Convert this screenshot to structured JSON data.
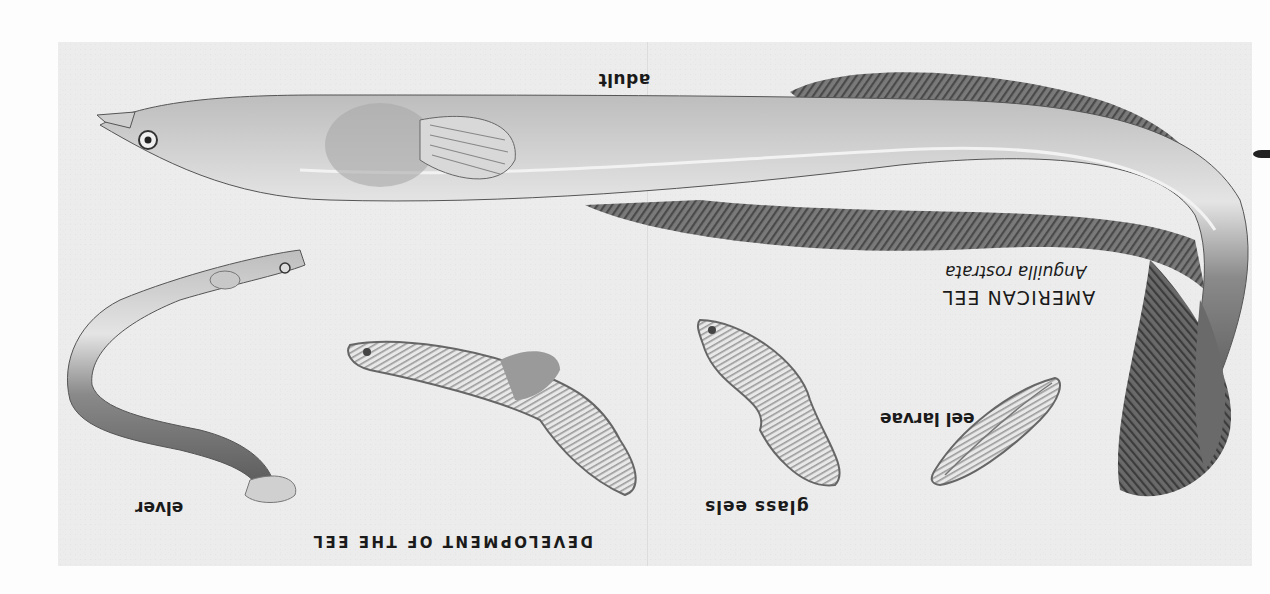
{
  "plate": {
    "title": "DEVELOPMENT OF THE EEL",
    "species_name": "AMERICAN EEL",
    "scientific_name": "Anguilla rostrata",
    "orientation": "rotated 180°",
    "labels": {
      "adult": "adult",
      "eel_larvae": "eel larvae",
      "glass_eels": "glass eels",
      "elver": "elver"
    },
    "illustrations": [
      {
        "name": "adult",
        "description": "large adult eel with dorsal and anal fins"
      },
      {
        "name": "eel larvae",
        "description": "leaf-shaped transparent larva"
      },
      {
        "name": "glass eels",
        "description": "two twisted ribbon-shaped larvae"
      },
      {
        "name": "elver",
        "description": "young curved eel"
      }
    ]
  },
  "colors": {
    "paper": "#fdfdfd",
    "plate_bg": "#ececec",
    "ink": "#1a1a1a",
    "body_dark": "#6e6e6e",
    "body_light": "#d6d6d6"
  }
}
